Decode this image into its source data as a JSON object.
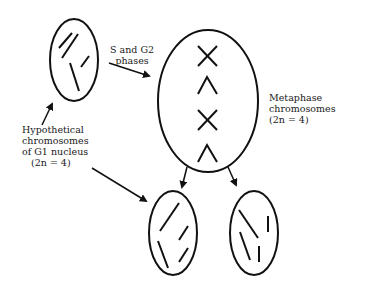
{
  "diagram": {
    "labels": {
      "s_g2": [
        "S and G2",
        "phases"
      ],
      "metaphase": [
        "Metaphase",
        "chromosomes",
        "(2n = 4)"
      ],
      "g1": [
        "Hypothetical",
        "chromosomes",
        "of G1 nucleus",
        "(2n = 4)"
      ]
    },
    "nodes": [
      {
        "id": "g1-nucleus",
        "description": "G1 nucleus with 4 unreplicated chromosomes"
      },
      {
        "id": "metaphase-cell",
        "description": "Cell with 4 replicated metaphase chromosomes (X and ^ shapes)"
      },
      {
        "id": "daughter-nucleus-1",
        "description": "Daughter nucleus with 4 chromosomes"
      },
      {
        "id": "daughter-nucleus-2",
        "description": "Daughter nucleus with 4 chromosomes"
      }
    ],
    "colors": {
      "stroke": "#111111",
      "background": "#ffffff"
    }
  }
}
